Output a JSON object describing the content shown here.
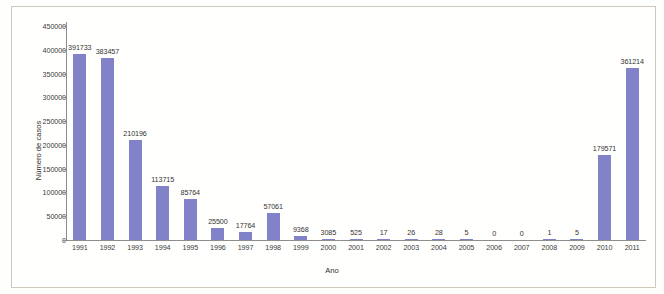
{
  "chart_data": {
    "type": "bar",
    "title": "",
    "xlabel": "Ano",
    "ylabel": "Número de casos",
    "categories": [
      "1991",
      "1992",
      "1993",
      "1994",
      "1995",
      "1996",
      "1997",
      "1998",
      "1999",
      "2000",
      "2001",
      "2002",
      "2003",
      "2004",
      "2005",
      "2006",
      "2007",
      "2008",
      "2009",
      "2010",
      "2011"
    ],
    "values": [
      391733,
      383457,
      210196,
      113715,
      85764,
      25500,
      17764,
      57061,
      9368,
      3085,
      525,
      17,
      26,
      28,
      5,
      0,
      0,
      1,
      5,
      179571,
      361214
    ],
    "value_labels": [
      "391733",
      "383457",
      "210196",
      "113715",
      "85764",
      "25500",
      "17764",
      "57061",
      "9368",
      "3085",
      "525",
      "17",
      "26",
      "28",
      "5",
      "0",
      "0",
      "1",
      "5",
      "179571",
      "361214"
    ],
    "ylim": [
      0,
      450000
    ],
    "yticks": [
      0,
      50000,
      100000,
      150000,
      200000,
      250000,
      300000,
      350000,
      400000,
      450000
    ],
    "ytick_labels": [
      "0",
      "50000",
      "100000",
      "150000",
      "200000",
      "250000",
      "300000",
      "350000",
      "400000",
      "450000"
    ],
    "grid": false,
    "legend": false,
    "bar_color": "#8282c9",
    "axis_color": "#8d8d8d",
    "text_color": "#333333",
    "background_color": "#fffffe"
  }
}
